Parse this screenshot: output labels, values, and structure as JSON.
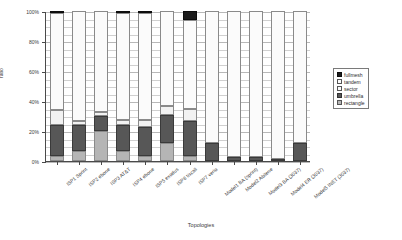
{
  "chart_data": {
    "type": "bar",
    "subtype": "stacked-100-percent",
    "title": "",
    "xlabel": "Topologies",
    "ylabel": "ratio",
    "ylim": [
      0,
      100
    ],
    "yticks": [
      "0%",
      "20%",
      "40%",
      "60%",
      "80%",
      "100%"
    ],
    "grid": true,
    "legend_position": "right",
    "stack_order_bottom_to_top": [
      "rectangle",
      "umbrella",
      "sector",
      "tandem",
      "fullmesh"
    ],
    "categories": [
      "ISP1 Sprint",
      "ISP2 ebone",
      "ISP3 AT&T",
      "ISP4 ebone",
      "ISP5 exodus",
      "ISP6 tiscali",
      "ISP7 verio",
      "Model1 BA (sprint)",
      "Model2 Abilene",
      "Model3 BA (3037)",
      "Model4 ER (3037)",
      "Model5 INET (3037)"
    ],
    "series": [
      {
        "name": "rectangle",
        "color": "#b5b5b5",
        "values": [
          3.5,
          7.0,
          20.0,
          6.5,
          3.5,
          12.0,
          3.5,
          0.0,
          0.0,
          0.0,
          0.0,
          0.0
        ]
      },
      {
        "name": "umbrella",
        "color": "#575757",
        "values": [
          20.5,
          17.0,
          10.0,
          17.5,
          19.0,
          18.5,
          23.0,
          12.0,
          2.5,
          2.5,
          1.0,
          12.0
        ]
      },
      {
        "name": "sector",
        "color": "#f2f2f2",
        "values": [
          10.0,
          2.5,
          3.0,
          3.5,
          5.0,
          6.0,
          8.5,
          0.0,
          0.0,
          0.0,
          0.0,
          0.0
        ]
      },
      {
        "name": "tandem",
        "color": "#fbfbfb",
        "values": [
          64.5,
          73.5,
          67.0,
          71.0,
          71.5,
          63.5,
          59.0,
          88.0,
          97.5,
          97.5,
          99.0,
          88.0
        ]
      },
      {
        "name": "fullmesh",
        "color": "#1c1c1c",
        "values": [
          1.5,
          0.0,
          0.0,
          1.5,
          1.0,
          0.0,
          6.0,
          0.0,
          0.0,
          0.0,
          0.0,
          0.0
        ]
      }
    ]
  },
  "legend": {
    "items": [
      {
        "key": "fullmesh",
        "label": "fullmesh"
      },
      {
        "key": "tandem",
        "label": "tandem"
      },
      {
        "key": "sector",
        "label": "sector"
      },
      {
        "key": "umbrella",
        "label": "umbrella"
      },
      {
        "key": "rectangle",
        "label": "rectangle"
      }
    ]
  }
}
